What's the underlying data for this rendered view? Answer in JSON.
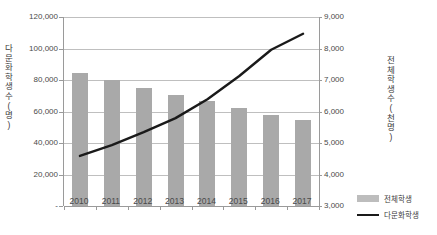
{
  "chart_data": {
    "type": "bar",
    "title": "",
    "xlabel": "",
    "categories": [
      "2010",
      "2011",
      "2012",
      "2013",
      "2014",
      "2015",
      "2016",
      "2017"
    ],
    "grid": true,
    "legend_position": "bottom-right",
    "axes": {
      "left": {
        "label": "다문화학생수(명)",
        "ylim": [
          0,
          120000
        ],
        "tick_step": 20000,
        "ticks": [
          "-",
          "20,000",
          "40,000",
          "60,000",
          "80,000",
          "100,000",
          "120,000"
        ],
        "tick_values": [
          0,
          20000,
          40000,
          60000,
          80000,
          100000,
          120000
        ]
      },
      "right": {
        "label": "전체학생수(천명)",
        "ylim": [
          3000,
          9000
        ],
        "tick_step": 1000,
        "ticks": [
          "3,000",
          "4,000",
          "5,000",
          "6,000",
          "7,000",
          "8,000",
          "9,000"
        ],
        "tick_values": [
          3000,
          4000,
          5000,
          6000,
          7000,
          8000,
          9000
        ]
      }
    },
    "series": [
      {
        "name": "전체학생",
        "type": "bar",
        "axis": "right",
        "unit": "천명",
        "color": "#a9a9a9",
        "values": [
          7236,
          6987,
          6732,
          6529,
          6334,
          6097,
          5890,
          5725
        ]
      },
      {
        "name": "다문화학생",
        "type": "line",
        "axis": "left",
        "unit": "명",
        "color": "#1a1a1a",
        "values": [
          31788,
          38678,
          46954,
          55780,
          67806,
          82536,
          99186,
          109387
        ]
      }
    ]
  },
  "legend": {
    "items": [
      {
        "label": "전체학생",
        "marker": "bar-swatch"
      },
      {
        "label": "다문화학생",
        "marker": "line-swatch"
      }
    ]
  }
}
